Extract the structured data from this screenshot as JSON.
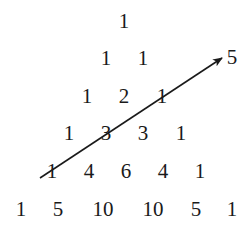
{
  "diagram": {
    "rows": [
      [
        "1"
      ],
      [
        "1",
        "1"
      ],
      [
        "1",
        "2",
        "1"
      ],
      [
        "1",
        "3",
        "3",
        "1"
      ],
      [
        "1",
        "4",
        "6",
        "4",
        "1"
      ],
      [
        "1",
        "5",
        "10",
        "10",
        "5",
        "1"
      ]
    ],
    "arrow_label": "5",
    "arrow": {
      "from": [
        40,
        178
      ],
      "to": [
        222,
        58
      ]
    }
  }
}
